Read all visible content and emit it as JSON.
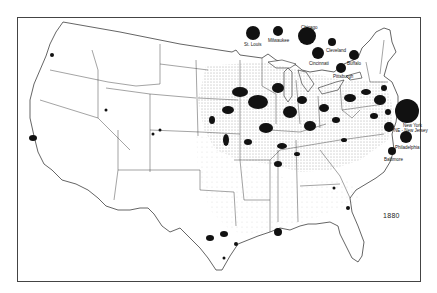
{
  "map": {
    "year": "1880",
    "colors": {
      "ink": "#111111",
      "border": "#444444",
      "background": "#ffffff",
      "stipple": "#555555"
    },
    "legend_cities": [
      {
        "name": "St. Louis",
        "cx": 253,
        "cy": 33,
        "r": 7,
        "lx": 244,
        "ly": 42
      },
      {
        "name": "Milwaukee",
        "cx": 278,
        "cy": 31,
        "r": 5,
        "lx": 268,
        "ly": 38
      },
      {
        "name": "Chicago",
        "cx": 307,
        "cy": 36,
        "r": 9,
        "lx": 301,
        "ly": 25
      },
      {
        "name": "Cleveland",
        "cx": 332,
        "cy": 42,
        "r": 4,
        "lx": 326,
        "ly": 48
      },
      {
        "name": "Cincinnati",
        "cx": 318,
        "cy": 53,
        "r": 6,
        "lx": 309,
        "ly": 61
      },
      {
        "name": "Buffalo",
        "cx": 354,
        "cy": 55,
        "r": 5,
        "lx": 347,
        "ly": 61
      },
      {
        "name": "Pittsburgh",
        "cx": 341,
        "cy": 68,
        "r": 5,
        "lx": 333,
        "ly": 74
      },
      {
        "name": "New York",
        "cx": 407,
        "cy": 111,
        "r": 12,
        "lx": 403,
        "ly": 123
      },
      {
        "name": "NE - New Jersey",
        "cx": 389,
        "cy": 127,
        "r": 5,
        "lx": 394,
        "ly": 128
      },
      {
        "name": "Philadelphia",
        "cx": 406,
        "cy": 137,
        "r": 6,
        "lx": 395,
        "ly": 145
      },
      {
        "name": "Baltimore",
        "cx": 392,
        "cy": 151,
        "r": 4,
        "lx": 384,
        "ly": 157
      }
    ]
  }
}
